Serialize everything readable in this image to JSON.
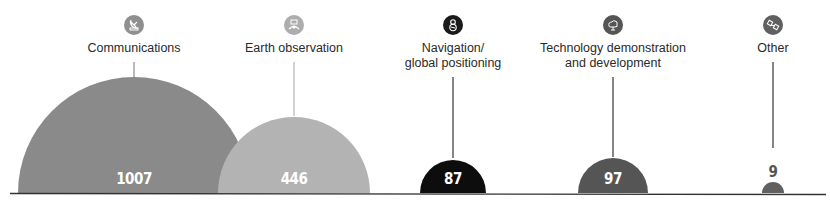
{
  "chart_data": {
    "type": "area",
    "subtype": "semicircle-proportional",
    "title": "",
    "xlabel": "",
    "ylabel": "",
    "grid": false,
    "legend": "none",
    "categories": [
      "Communications",
      "Earth observation",
      "Navigation/ global positioning",
      "Technology demonstration and development",
      "Other"
    ],
    "values": [
      1007,
      446,
      87,
      97,
      9
    ]
  },
  "items": [
    {
      "label_lines": [
        "Communications"
      ],
      "value": "1007",
      "icon": "satellite-dish-icon",
      "color": "#8a8a8a",
      "icon_color": "#8f8f8f",
      "cx": 134,
      "r": 116,
      "label_x": 134
    },
    {
      "label_lines": [
        "Earth observation"
      ],
      "value": "446",
      "icon": "earth-observation-icon",
      "color": "#b3b3b3",
      "icon_color": "#adadad",
      "cx": 294,
      "r": 76,
      "label_x": 294
    },
    {
      "label_lines": [
        "Navigation/",
        "global positioning"
      ],
      "value": "87",
      "icon": "navigation-icon",
      "color": "#0d0d0d",
      "icon_color": "#1a1a1a",
      "cx": 453,
      "r": 33,
      "label_x": 453
    },
    {
      "label_lines": [
        "Technology demonstration",
        "and development"
      ],
      "value": "97",
      "icon": "technology-icon",
      "color": "#555555",
      "icon_color": "#555555",
      "cx": 613,
      "r": 35,
      "label_x": 613
    },
    {
      "label_lines": [
        "Other"
      ],
      "value": "9",
      "icon": "other-satellite-icon",
      "color": "#606060",
      "icon_color": "#606060",
      "cx": 773,
      "r": 11,
      "label_x": 773
    }
  ],
  "baseline": {
    "y": 193,
    "x1": 10,
    "x2": 826,
    "color": "#333333"
  }
}
